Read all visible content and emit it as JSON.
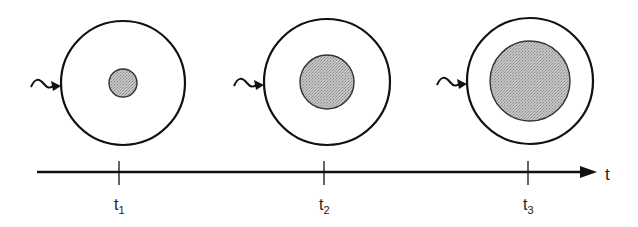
{
  "diagram": {
    "stages": [
      {
        "label": "t",
        "sub": "1",
        "cx": 123,
        "cy": 83,
        "outer_r": 62,
        "inner_r": 14,
        "tick_x": 119
      },
      {
        "label": "t",
        "sub": "2",
        "cx": 327,
        "cy": 82,
        "outer_r": 63,
        "inner_r": 27,
        "tick_x": 324
      },
      {
        "label": "t",
        "sub": "3",
        "cx": 530,
        "cy": 81,
        "outer_r": 63,
        "inner_r": 40,
        "tick_x": 528
      }
    ],
    "axis": {
      "label": "t",
      "x_start": 37,
      "x_end": 597,
      "y": 172
    },
    "colors": {
      "stroke": "#111111",
      "fill": "#bdbdbd"
    }
  }
}
